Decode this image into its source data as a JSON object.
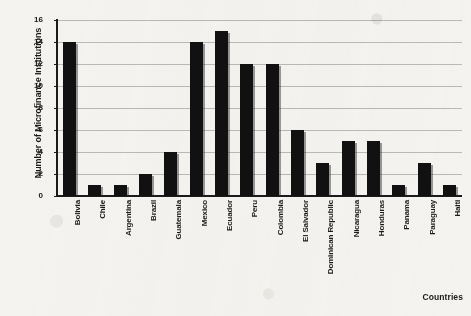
{
  "chart_data": {
    "type": "bar",
    "title": "",
    "xlabel": "Countries",
    "ylabel": "Number of Microfinance Institutions",
    "categories": [
      "Bolivia",
      "Chile",
      "Argentina",
      "Brazil",
      "Guatemala",
      "Mexico",
      "Ecuador",
      "Peru",
      "Colombia",
      "El Salvador",
      "Dominican Republic",
      "Nicaragua",
      "Honduras",
      "Panama",
      "Paraguay",
      "Haiti"
    ],
    "values": [
      14,
      1,
      1,
      2,
      4,
      14,
      15,
      12,
      12,
      6,
      3,
      5,
      5,
      1,
      3,
      1
    ],
    "ylim": [
      0,
      16
    ],
    "ytick_labels": [
      "0",
      "2",
      "4",
      "6",
      "8",
      "10",
      "12",
      "14",
      "16"
    ],
    "ytick_values": [
      0,
      2,
      4,
      6,
      8,
      10,
      12,
      14,
      16
    ],
    "grid": true,
    "legend": false,
    "bar_color": "#111111"
  }
}
